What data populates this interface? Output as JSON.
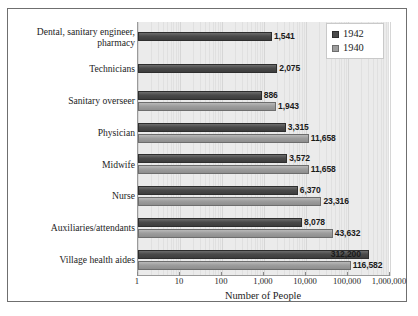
{
  "chart_data": {
    "type": "bar",
    "orientation": "horizontal",
    "title": "",
    "xlabel": "Number of People",
    "ylabel": "",
    "xscale": "log",
    "xlim": [
      1,
      1000000
    ],
    "xticks": [
      "1",
      "10",
      "100",
      "1,000",
      "10,000",
      "100,000",
      "1,000,000"
    ],
    "xtick_values": [
      1,
      10,
      100,
      1000,
      10000,
      100000,
      1000000
    ],
    "grid": true,
    "legend_position": "top-right",
    "categories": [
      "Dental, sanitary engineer,\npharmacy",
      "Technicians",
      "Sanitary overseer",
      "Physician",
      "Midwife",
      "Nurse",
      "Auxiliaries/attendants",
      "Village health aides"
    ],
    "series": [
      {
        "name": "1942",
        "color": "#4a4a4a",
        "values": [
          1541,
          2075,
          886,
          3315,
          3572,
          6370,
          8078,
          312200
        ],
        "labels": [
          "1,541",
          "2,075",
          "886",
          "3,315",
          "3,572",
          "6,370",
          "8,078",
          "312,200"
        ]
      },
      {
        "name": "1940",
        "color": "#9d9d9d",
        "values": [
          null,
          null,
          1943,
          11658,
          11658,
          23316,
          43632,
          116582
        ],
        "labels": [
          "",
          "",
          "1,943",
          "11,658",
          "11,658",
          "23,316",
          "43,632",
          "116,582"
        ]
      }
    ]
  },
  "legend": {
    "items": [
      {
        "label": "1942",
        "color": "#4a4a4a"
      },
      {
        "label": "1940",
        "color": "#9d9d9d"
      }
    ]
  }
}
